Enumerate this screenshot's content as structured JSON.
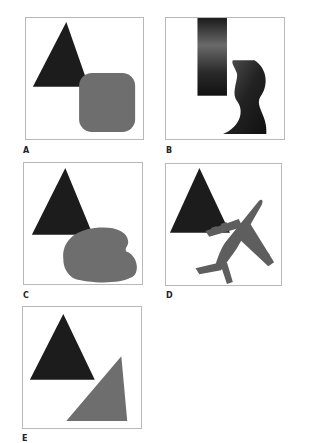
{
  "colors": {
    "dark_shape": "#1c1c1c",
    "gray_shape": "#6e6e6e",
    "border": "#b8b8b8"
  },
  "panels": [
    {
      "label": "A",
      "shapes": [
        "triangle",
        "rounded-square"
      ]
    },
    {
      "label": "B",
      "shapes": [
        "vertical-bar",
        "wavy-bar"
      ]
    },
    {
      "label": "C",
      "shapes": [
        "triangle",
        "bean-blob"
      ]
    },
    {
      "label": "D",
      "shapes": [
        "triangle",
        "airplane"
      ]
    },
    {
      "label": "E",
      "shapes": [
        "triangle",
        "gray-triangle"
      ]
    }
  ]
}
